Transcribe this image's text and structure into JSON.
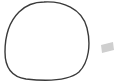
{
  "canvas": {
    "width": 115,
    "height": 84,
    "background": "#ffffff"
  },
  "shapes": [
    {
      "type": "circle-outline",
      "style": "hand-drawn",
      "stroke": "#3a3a3a",
      "fill": "none",
      "bounds": {
        "x": 4,
        "y": 1,
        "width": 85,
        "height": 79
      }
    },
    {
      "type": "parallelogram",
      "fill": "#cfcfcf",
      "bounds": {
        "x": 100,
        "y": 42,
        "width": 14,
        "height": 10
      }
    }
  ]
}
